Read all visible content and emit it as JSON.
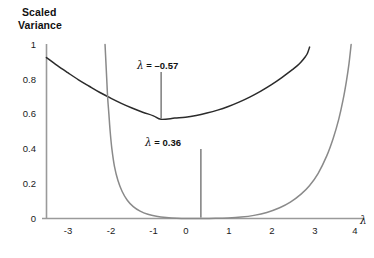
{
  "chart_data": {
    "type": "line",
    "title": "Scaled Variance",
    "title_lines": [
      "Scaled",
      "Variance"
    ],
    "xlabel": "λ",
    "ylabel": "Scaled Variance",
    "xlim": [
      -3.55,
      4.2
    ],
    "ylim": [
      0,
      1.02
    ],
    "grid": false,
    "legend": null,
    "xticks": [
      "-3",
      "-2",
      "-1",
      "0",
      "1",
      "2",
      "3",
      "4"
    ],
    "xtick_values": [
      -3,
      -2,
      -1,
      0,
      1,
      2,
      3,
      4
    ],
    "yticks": [
      "0",
      "0.2",
      "0.4",
      "0.6",
      "0.8",
      "1"
    ],
    "ytick_values": [
      0,
      0.2,
      0.4,
      0.6,
      0.8,
      1
    ],
    "series": [
      {
        "name": "wide-variance-curve",
        "color": "#2b2b2b",
        "minimum_x": -0.57,
        "minimum_y": 0.57,
        "points": [
          [
            -3.25,
            0.925
          ],
          [
            -3.0,
            0.88
          ],
          [
            -2.75,
            0.838
          ],
          [
            -2.5,
            0.797
          ],
          [
            -2.25,
            0.76
          ],
          [
            -2.0,
            0.724
          ],
          [
            -1.75,
            0.692
          ],
          [
            -1.5,
            0.662
          ],
          [
            -1.25,
            0.635
          ],
          [
            -1.0,
            0.611
          ],
          [
            -0.75,
            0.59
          ],
          [
            -0.57,
            0.57
          ],
          [
            -0.25,
            0.577
          ],
          [
            0.0,
            0.582
          ],
          [
            0.25,
            0.592
          ],
          [
            0.5,
            0.606
          ],
          [
            0.75,
            0.623
          ],
          [
            1.0,
            0.644
          ],
          [
            1.25,
            0.669
          ],
          [
            1.5,
            0.698
          ],
          [
            1.75,
            0.731
          ],
          [
            2.0,
            0.768
          ],
          [
            2.25,
            0.81
          ],
          [
            2.5,
            0.856
          ],
          [
            2.6,
            0.876
          ],
          [
            2.7,
            0.9
          ],
          [
            2.8,
            0.93
          ],
          [
            2.85,
            0.95
          ],
          [
            2.9,
            0.985
          ]
        ]
      },
      {
        "name": "narrow-variance-curve",
        "color": "#8a8a8a",
        "minimum_x": 0.36,
        "minimum_y": 0.0,
        "points": [
          [
            -1.88,
            1.0
          ],
          [
            -1.86,
            0.9
          ],
          [
            -1.84,
            0.8
          ],
          [
            -1.82,
            0.7
          ],
          [
            -1.79,
            0.6
          ],
          [
            -1.76,
            0.5
          ],
          [
            -1.72,
            0.4
          ],
          [
            -1.66,
            0.3
          ],
          [
            -1.58,
            0.22
          ],
          [
            -1.48,
            0.155
          ],
          [
            -1.36,
            0.105
          ],
          [
            -1.22,
            0.068
          ],
          [
            -1.06,
            0.042
          ],
          [
            -0.88,
            0.024
          ],
          [
            -0.68,
            0.013
          ],
          [
            -0.45,
            0.006
          ],
          [
            -0.2,
            0.002
          ],
          [
            0.1,
            0.0005
          ],
          [
            0.36,
            0.0
          ],
          [
            0.7,
            0.0008
          ],
          [
            1.0,
            0.003
          ],
          [
            1.3,
            0.008
          ],
          [
            1.6,
            0.018
          ],
          [
            1.9,
            0.035
          ],
          [
            2.2,
            0.062
          ],
          [
            2.45,
            0.094
          ],
          [
            2.7,
            0.14
          ],
          [
            2.9,
            0.19
          ],
          [
            3.1,
            0.26
          ],
          [
            3.3,
            0.36
          ],
          [
            3.45,
            0.46
          ],
          [
            3.58,
            0.57
          ],
          [
            3.68,
            0.68
          ],
          [
            3.76,
            0.79
          ],
          [
            3.82,
            0.89
          ],
          [
            3.87,
            1.0
          ]
        ]
      }
    ],
    "annotations": [
      {
        "id": "annotation-lambda-neg",
        "lambda_symbol": "λ",
        "text": " = –0.57",
        "full_text": "λ = –0.57",
        "value": -0.57,
        "pointer_to_x": -0.57,
        "pointer_to_y": 0.57
      },
      {
        "id": "annotation-lambda-pos",
        "lambda_symbol": "λ",
        "text": " = 0.36",
        "full_text": "λ = 0.36",
        "value": 0.36,
        "pointer_to_x": 0.36,
        "pointer_to_y": 0.0
      }
    ]
  },
  "figure": {
    "title_lines": {
      "line1": "Scaled",
      "line2": "Variance"
    },
    "x_axis_variable": "λ",
    "yticks": {
      "t0": "0",
      "t1": "0.2",
      "t2": "0.4",
      "t3": "0.6",
      "t4": "0.8",
      "t5": "1"
    },
    "xticks": {
      "t0": "-3",
      "t1": "-2",
      "t2": "-1",
      "t3": "0",
      "t4": "1",
      "t5": "2",
      "t6": "3",
      "t7": "4"
    },
    "annotation_neg": {
      "symbol": "λ",
      "rest": " = –0.57"
    },
    "annotation_pos": {
      "symbol": "λ",
      "rest": " = 0.36"
    }
  }
}
